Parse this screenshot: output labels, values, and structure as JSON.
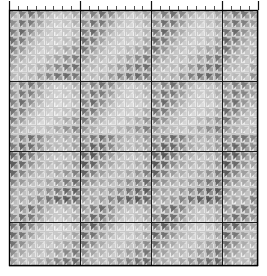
{
  "figure": {
    "background_color": "#ffffff",
    "width": 267,
    "height": 276
  },
  "chart_data": {
    "type": "heatmap",
    "title": "",
    "subtitle": "",
    "xlabel": "",
    "ylabel": "",
    "legend": [],
    "annotations": [],
    "grid": true,
    "grid_minor_color": "#c8c8c8",
    "grid_major_color": "#1a1a1a",
    "border_color": "#000000",
    "cell_glyph": "pinwheel",
    "glyph_colors": {
      "light": "#f2f2f2",
      "mid": "#b4b4b4",
      "dark": "#6e6e6e",
      "darkest": "#4a4a4a"
    },
    "plot_area": {
      "left": 9,
      "top": 10,
      "width": 249,
      "height": 256
    },
    "nx": 28,
    "ny": 29,
    "major_every_x": 8,
    "major_every_y": 8,
    "xlim": [
      0,
      28
    ],
    "ylim": [
      0,
      29
    ],
    "x_tick_labels": [],
    "y_tick_labels": [],
    "top_axis_minor_ticks": 28,
    "top_axis_major_ticks": [
      0,
      8,
      16,
      24,
      28
    ],
    "vmin": 0,
    "vmax": 1,
    "colorscale": "grayscale-inverted",
    "pattern_description": "periodic chevron / V-shaped diagonal bands of darker cells repeating every 8 columns and 8 rows",
    "values": [
      [
        0.42,
        0.55,
        0.62,
        0.5,
        0.34,
        0.26,
        0.3,
        0.38,
        0.44,
        0.56,
        0.63,
        0.51,
        0.35,
        0.27,
        0.31,
        0.39,
        0.45,
        0.57,
        0.64,
        0.52,
        0.36,
        0.28,
        0.32,
        0.4,
        0.46,
        0.58,
        0.6,
        0.48
      ],
      [
        0.5,
        0.62,
        0.58,
        0.42,
        0.28,
        0.22,
        0.26,
        0.34,
        0.52,
        0.63,
        0.59,
        0.43,
        0.29,
        0.23,
        0.27,
        0.35,
        0.53,
        0.64,
        0.6,
        0.44,
        0.3,
        0.24,
        0.28,
        0.36,
        0.54,
        0.62,
        0.56,
        0.44
      ],
      [
        0.58,
        0.66,
        0.5,
        0.34,
        0.24,
        0.2,
        0.24,
        0.32,
        0.6,
        0.67,
        0.51,
        0.35,
        0.25,
        0.21,
        0.25,
        0.33,
        0.61,
        0.68,
        0.52,
        0.36,
        0.26,
        0.22,
        0.26,
        0.34,
        0.62,
        0.66,
        0.48,
        0.38
      ],
      [
        0.64,
        0.58,
        0.4,
        0.28,
        0.22,
        0.22,
        0.28,
        0.38,
        0.66,
        0.59,
        0.41,
        0.29,
        0.23,
        0.23,
        0.29,
        0.39,
        0.67,
        0.6,
        0.42,
        0.3,
        0.24,
        0.24,
        0.3,
        0.4,
        0.68,
        0.58,
        0.4,
        0.32
      ],
      [
        0.6,
        0.46,
        0.32,
        0.24,
        0.24,
        0.3,
        0.38,
        0.48,
        0.62,
        0.47,
        0.33,
        0.25,
        0.25,
        0.31,
        0.39,
        0.49,
        0.63,
        0.48,
        0.34,
        0.26,
        0.26,
        0.32,
        0.4,
        0.5,
        0.64,
        0.46,
        0.34,
        0.3
      ],
      [
        0.48,
        0.36,
        0.28,
        0.26,
        0.32,
        0.4,
        0.5,
        0.58,
        0.5,
        0.37,
        0.29,
        0.27,
        0.33,
        0.41,
        0.51,
        0.59,
        0.51,
        0.38,
        0.3,
        0.28,
        0.34,
        0.42,
        0.52,
        0.6,
        0.52,
        0.38,
        0.3,
        0.34
      ],
      [
        0.38,
        0.3,
        0.28,
        0.34,
        0.42,
        0.52,
        0.6,
        0.64,
        0.4,
        0.31,
        0.29,
        0.35,
        0.43,
        0.53,
        0.61,
        0.65,
        0.41,
        0.32,
        0.3,
        0.36,
        0.44,
        0.54,
        0.62,
        0.66,
        0.42,
        0.32,
        0.28,
        0.4
      ],
      [
        0.32,
        0.3,
        0.34,
        0.44,
        0.54,
        0.62,
        0.66,
        0.6,
        0.34,
        0.31,
        0.35,
        0.45,
        0.55,
        0.63,
        0.67,
        0.61,
        0.35,
        0.32,
        0.36,
        0.46,
        0.56,
        0.64,
        0.68,
        0.62,
        0.36,
        0.3,
        0.32,
        0.48
      ],
      [
        0.4,
        0.52,
        0.6,
        0.48,
        0.32,
        0.24,
        0.28,
        0.36,
        0.42,
        0.54,
        0.62,
        0.5,
        0.33,
        0.25,
        0.29,
        0.37,
        0.43,
        0.55,
        0.63,
        0.51,
        0.34,
        0.26,
        0.3,
        0.38,
        0.44,
        0.56,
        0.58,
        0.46
      ],
      [
        0.48,
        0.6,
        0.56,
        0.4,
        0.26,
        0.2,
        0.24,
        0.32,
        0.5,
        0.62,
        0.58,
        0.42,
        0.27,
        0.21,
        0.25,
        0.33,
        0.51,
        0.63,
        0.59,
        0.43,
        0.28,
        0.22,
        0.26,
        0.34,
        0.52,
        0.6,
        0.54,
        0.42
      ],
      [
        0.56,
        0.64,
        0.48,
        0.32,
        0.22,
        0.18,
        0.22,
        0.3,
        0.58,
        0.66,
        0.5,
        0.34,
        0.23,
        0.19,
        0.23,
        0.31,
        0.59,
        0.67,
        0.51,
        0.35,
        0.24,
        0.2,
        0.24,
        0.32,
        0.6,
        0.64,
        0.46,
        0.36
      ],
      [
        0.62,
        0.56,
        0.38,
        0.26,
        0.2,
        0.2,
        0.26,
        0.36,
        0.64,
        0.58,
        0.4,
        0.28,
        0.21,
        0.21,
        0.27,
        0.37,
        0.65,
        0.59,
        0.41,
        0.29,
        0.22,
        0.22,
        0.28,
        0.38,
        0.66,
        0.56,
        0.38,
        0.3
      ],
      [
        0.58,
        0.44,
        0.3,
        0.22,
        0.22,
        0.28,
        0.36,
        0.46,
        0.6,
        0.46,
        0.32,
        0.24,
        0.23,
        0.29,
        0.37,
        0.47,
        0.61,
        0.47,
        0.33,
        0.25,
        0.24,
        0.3,
        0.38,
        0.48,
        0.62,
        0.44,
        0.32,
        0.28
      ],
      [
        0.46,
        0.34,
        0.26,
        0.24,
        0.3,
        0.38,
        0.48,
        0.56,
        0.48,
        0.36,
        0.28,
        0.26,
        0.31,
        0.39,
        0.49,
        0.57,
        0.49,
        0.37,
        0.29,
        0.27,
        0.32,
        0.4,
        0.5,
        0.58,
        0.5,
        0.36,
        0.28,
        0.32
      ],
      [
        0.5,
        0.58,
        0.64,
        0.54,
        0.4,
        0.34,
        0.38,
        0.46,
        0.52,
        0.6,
        0.66,
        0.56,
        0.41,
        0.35,
        0.39,
        0.47,
        0.53,
        0.61,
        0.67,
        0.57,
        0.42,
        0.36,
        0.4,
        0.48,
        0.54,
        0.62,
        0.62,
        0.52
      ],
      [
        0.58,
        0.68,
        0.64,
        0.5,
        0.36,
        0.3,
        0.34,
        0.42,
        0.6,
        0.7,
        0.66,
        0.52,
        0.37,
        0.31,
        0.35,
        0.43,
        0.61,
        0.71,
        0.67,
        0.53,
        0.38,
        0.32,
        0.36,
        0.44,
        0.62,
        0.68,
        0.6,
        0.5
      ],
      [
        0.66,
        0.72,
        0.58,
        0.42,
        0.32,
        0.28,
        0.32,
        0.4,
        0.68,
        0.74,
        0.6,
        0.44,
        0.33,
        0.29,
        0.33,
        0.41,
        0.69,
        0.75,
        0.61,
        0.45,
        0.34,
        0.3,
        0.34,
        0.42,
        0.7,
        0.72,
        0.56,
        0.46
      ],
      [
        0.72,
        0.66,
        0.48,
        0.36,
        0.3,
        0.3,
        0.36,
        0.46,
        0.74,
        0.68,
        0.5,
        0.38,
        0.31,
        0.31,
        0.37,
        0.47,
        0.75,
        0.69,
        0.51,
        0.39,
        0.32,
        0.32,
        0.38,
        0.48,
        0.76,
        0.66,
        0.48,
        0.4
      ],
      [
        0.68,
        0.54,
        0.4,
        0.32,
        0.32,
        0.38,
        0.46,
        0.56,
        0.7,
        0.56,
        0.42,
        0.34,
        0.33,
        0.39,
        0.47,
        0.57,
        0.71,
        0.57,
        0.43,
        0.35,
        0.34,
        0.4,
        0.48,
        0.58,
        0.72,
        0.54,
        0.42,
        0.38
      ],
      [
        0.56,
        0.44,
        0.36,
        0.34,
        0.4,
        0.48,
        0.58,
        0.66,
        0.58,
        0.46,
        0.38,
        0.36,
        0.41,
        0.49,
        0.59,
        0.67,
        0.59,
        0.47,
        0.39,
        0.37,
        0.42,
        0.5,
        0.6,
        0.68,
        0.6,
        0.46,
        0.38,
        0.42
      ],
      [
        0.46,
        0.38,
        0.36,
        0.42,
        0.5,
        0.6,
        0.68,
        0.72,
        0.48,
        0.4,
        0.38,
        0.44,
        0.51,
        0.61,
        0.69,
        0.73,
        0.49,
        0.41,
        0.39,
        0.45,
        0.52,
        0.62,
        0.7,
        0.74,
        0.5,
        0.4,
        0.36,
        0.48
      ],
      [
        0.4,
        0.38,
        0.42,
        0.52,
        0.62,
        0.7,
        0.74,
        0.68,
        0.42,
        0.4,
        0.44,
        0.54,
        0.63,
        0.71,
        0.75,
        0.69,
        0.43,
        0.41,
        0.45,
        0.55,
        0.64,
        0.72,
        0.76,
        0.7,
        0.44,
        0.38,
        0.4,
        0.56
      ],
      [
        0.44,
        0.56,
        0.64,
        0.52,
        0.36,
        0.28,
        0.32,
        0.4,
        0.46,
        0.58,
        0.66,
        0.54,
        0.37,
        0.29,
        0.33,
        0.41,
        0.47,
        0.59,
        0.67,
        0.55,
        0.38,
        0.3,
        0.34,
        0.42,
        0.48,
        0.6,
        0.62,
        0.5
      ],
      [
        0.52,
        0.64,
        0.6,
        0.44,
        0.3,
        0.24,
        0.28,
        0.36,
        0.54,
        0.66,
        0.62,
        0.46,
        0.31,
        0.25,
        0.29,
        0.37,
        0.55,
        0.67,
        0.63,
        0.47,
        0.32,
        0.26,
        0.3,
        0.38,
        0.56,
        0.64,
        0.58,
        0.46
      ],
      [
        0.6,
        0.68,
        0.52,
        0.36,
        0.26,
        0.22,
        0.26,
        0.34,
        0.62,
        0.7,
        0.54,
        0.38,
        0.27,
        0.23,
        0.27,
        0.35,
        0.63,
        0.71,
        0.55,
        0.39,
        0.28,
        0.24,
        0.28,
        0.36,
        0.64,
        0.68,
        0.5,
        0.4
      ],
      [
        0.66,
        0.6,
        0.42,
        0.3,
        0.24,
        0.24,
        0.3,
        0.4,
        0.68,
        0.62,
        0.44,
        0.32,
        0.25,
        0.25,
        0.31,
        0.41,
        0.69,
        0.63,
        0.45,
        0.33,
        0.26,
        0.26,
        0.32,
        0.42,
        0.7,
        0.6,
        0.42,
        0.34
      ],
      [
        0.62,
        0.48,
        0.34,
        0.26,
        0.26,
        0.32,
        0.4,
        0.5,
        0.64,
        0.5,
        0.36,
        0.28,
        0.27,
        0.33,
        0.41,
        0.51,
        0.65,
        0.51,
        0.37,
        0.29,
        0.28,
        0.34,
        0.42,
        0.52,
        0.66,
        0.48,
        0.36,
        0.32
      ],
      [
        0.5,
        0.38,
        0.3,
        0.28,
        0.34,
        0.42,
        0.52,
        0.6,
        0.52,
        0.4,
        0.32,
        0.3,
        0.35,
        0.43,
        0.53,
        0.61,
        0.53,
        0.41,
        0.33,
        0.31,
        0.36,
        0.44,
        0.54,
        0.62,
        0.54,
        0.4,
        0.32,
        0.36
      ],
      [
        0.44,
        0.34,
        0.3,
        0.36,
        0.44,
        0.54,
        0.62,
        0.66,
        0.46,
        0.36,
        0.32,
        0.38,
        0.45,
        0.55,
        0.63,
        0.67,
        0.47,
        0.37,
        0.33,
        0.39,
        0.46,
        0.56,
        0.64,
        0.68,
        0.48,
        0.36,
        0.3,
        0.44
      ]
    ]
  }
}
